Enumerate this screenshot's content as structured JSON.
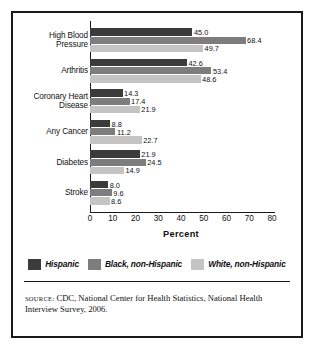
{
  "chart_data": {
    "type": "bar",
    "orientation": "horizontal",
    "title": "",
    "xlabel": "Percent",
    "ylabel": "",
    "xlim": [
      0,
      80
    ],
    "xticks": [
      0,
      10,
      20,
      30,
      40,
      50,
      60,
      70,
      80
    ],
    "grid": false,
    "legend_position": "bottom",
    "categories": [
      "High Blood Pressure",
      "Arthritis",
      "Coronary Heart Disease",
      "Any Cancer",
      "Diabetes",
      "Stroke"
    ],
    "category_lines": [
      [
        "High Blood",
        "Pressure"
      ],
      [
        "Arthritis"
      ],
      [
        "Coronary Heart",
        "Disease"
      ],
      [
        "Any Cancer"
      ],
      [
        "Diabetes"
      ],
      [
        "Stroke"
      ]
    ],
    "series": [
      {
        "name": "Hispanic",
        "color": "#3b3b3b",
        "values": [
          45.0,
          42.6,
          14.3,
          8.8,
          21.9,
          8.0
        ],
        "labels": [
          "45.0",
          "42.6",
          "14.3",
          "8.8",
          "21.9",
          "8.0"
        ]
      },
      {
        "name": "Black, non-Hispanic",
        "color": "#7d7d7d",
        "values": [
          68.4,
          53.4,
          17.4,
          11.2,
          24.5,
          9.6
        ],
        "labels": [
          "68.4",
          "53.4",
          "17.4",
          "11.2",
          "24.5",
          "9.6"
        ]
      },
      {
        "name": "White, non-Hispanic",
        "color": "#c4c4c4",
        "values": [
          49.7,
          48.6,
          21.9,
          22.7,
          14.9,
          8.6
        ],
        "labels": [
          "49.7",
          "48.6",
          "21.9",
          "22.7",
          "14.9",
          "8.6"
        ]
      }
    ]
  },
  "source": {
    "label": "SOURCE:",
    "text": " CDC, National Center for Health  Statistics, National Health Interview Survey, 2006."
  },
  "colors": {
    "frame": "#1a1a1a",
    "axis": "#1a1a1a",
    "text": "#111111",
    "background": "#ffffff"
  }
}
